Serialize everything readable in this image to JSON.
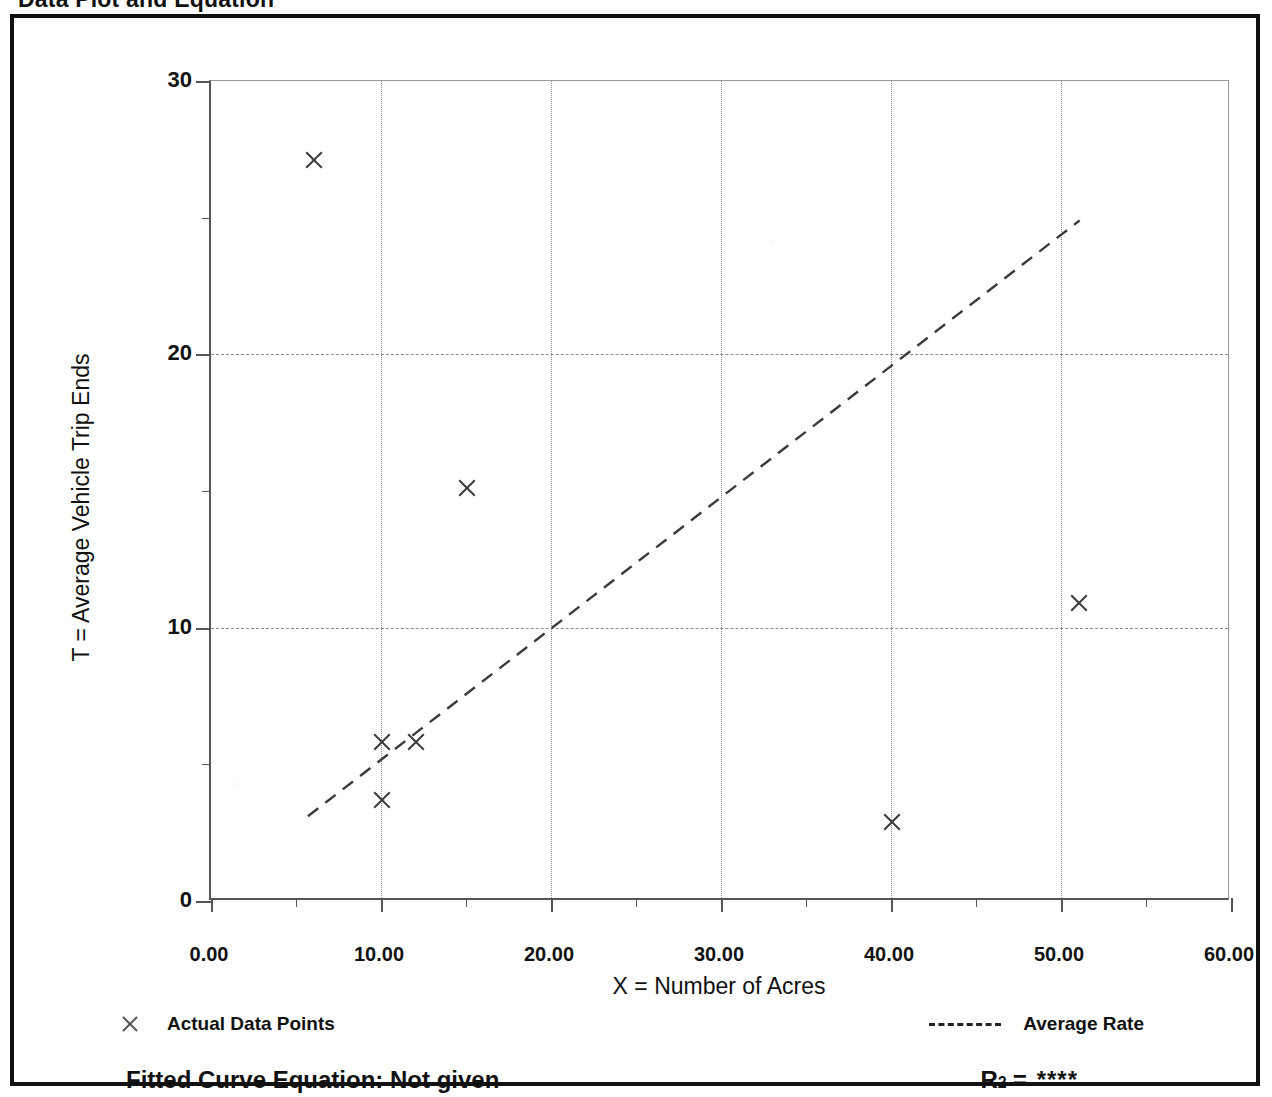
{
  "page": {
    "title": "Data Plot and Equation"
  },
  "chart_data": {
    "type": "scatter",
    "title": "Data Plot and Equation",
    "xlabel": "X = Number of Acres",
    "ylabel": "T = Average Vehicle Trip Ends",
    "xlim": [
      0,
      60
    ],
    "ylim": [
      0,
      30
    ],
    "xticks": [
      0,
      10,
      20,
      30,
      40,
      50,
      60
    ],
    "xtick_labels": [
      "0.00",
      "10.00",
      "20.00",
      "30.00",
      "40.00",
      "50.00",
      "60.00"
    ],
    "xticks_minor": [
      5,
      15,
      25,
      35,
      45,
      55
    ],
    "yticks": [
      0,
      10,
      20,
      30
    ],
    "ytick_labels": [
      "0",
      "10",
      "20",
      "30"
    ],
    "yticks_minor": [
      5,
      15,
      25
    ],
    "grid": true,
    "grid_style": "dotted",
    "legend_position": "below-axes",
    "series": [
      {
        "name": "Actual Data Points",
        "type": "scatter",
        "marker": "x",
        "points": [
          {
            "x": 6.0,
            "y": 27.1
          },
          {
            "x": 15.0,
            "y": 15.1
          },
          {
            "x": 51.0,
            "y": 10.9
          },
          {
            "x": 10.0,
            "y": 5.8
          },
          {
            "x": 12.0,
            "y": 5.8
          },
          {
            "x": 10.0,
            "y": 3.7
          },
          {
            "x": 40.0,
            "y": 2.9
          }
        ]
      },
      {
        "name": "Average Rate",
        "type": "line",
        "style": "dashed",
        "points": [
          {
            "x": 5.7,
            "y": 3.1
          },
          {
            "x": 51.1,
            "y": 24.9
          }
        ]
      }
    ]
  },
  "legend": {
    "data_points_label": "Actual Data Points",
    "average_rate_label": "Average Rate",
    "data_points_icon": "x-marker-icon",
    "average_rate_icon": "dashed-line-icon"
  },
  "footer": {
    "equation_text": "Fitted Curve Equation:  Not given",
    "r2_label": "R",
    "r2_exponent": "2",
    "r2_equals": "=",
    "r2_value": "****"
  }
}
